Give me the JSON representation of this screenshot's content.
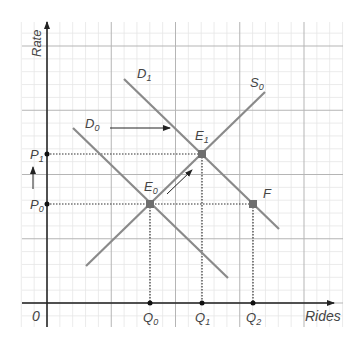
{
  "axes": {
    "x_label": "Rides",
    "y_label": "Rate",
    "origin_label": "0"
  },
  "curves": {
    "D0": {
      "label": "D",
      "sub": "0"
    },
    "D1": {
      "label": "D",
      "sub": "1"
    },
    "S0": {
      "label": "S",
      "sub": "0"
    }
  },
  "points": {
    "E0": {
      "label": "E",
      "sub": "0"
    },
    "E1": {
      "label": "E",
      "sub": "1"
    },
    "F": {
      "label": "F",
      "sub": ""
    }
  },
  "price_ticks": [
    {
      "label": "P",
      "sub": "1"
    },
    {
      "label": "P",
      "sub": "0"
    }
  ],
  "quantity_ticks": [
    {
      "label": "Q",
      "sub": "0"
    },
    {
      "label": "Q",
      "sub": "1"
    },
    {
      "label": "Q",
      "sub": "2"
    }
  ],
  "colors": {
    "curve": "#8a8a8a",
    "axis": "#222222",
    "grid_minor": "#e6e6e6",
    "grid_major": "#b5b5b5",
    "point": "#6e6e6e",
    "dotted": "#333333"
  },
  "chart_data": {
    "type": "line",
    "title": "",
    "xlabel": "Rides",
    "ylabel": "Rate",
    "grid": true,
    "series": [
      {
        "name": "D0",
        "points": [
          [
            0.5,
            3.4
          ],
          [
            3.0,
            0.5
          ]
        ]
      },
      {
        "name": "D1",
        "points": [
          [
            1.2,
            4.4
          ],
          [
            3.7,
            1.4
          ]
        ]
      },
      {
        "name": "S0",
        "points": [
          [
            0.6,
            0.6
          ],
          [
            3.4,
            3.3
          ]
        ]
      }
    ],
    "annotations": [
      {
        "name": "E0",
        "x": "Q0",
        "y": "P0",
        "desc": "initial equilibrium (D0 ∩ S0)"
      },
      {
        "name": "E1",
        "x": "Q1",
        "y": "P1",
        "desc": "new equilibrium (D1 ∩ S0)"
      },
      {
        "name": "F",
        "x": "Q2",
        "y": "P0",
        "desc": "D1 at old price P0"
      },
      {
        "name": "demand-shift-arrow",
        "desc": "D0 → D1 rightward shift"
      },
      {
        "name": "movement-along-supply-arrow",
        "desc": "E0 → E1 along S0"
      },
      {
        "name": "price-rise-arrow",
        "desc": "P0 → P1"
      }
    ],
    "x_ticks": [
      "Q0",
      "Q1",
      "Q2"
    ],
    "y_ticks": [
      "P0",
      "P1"
    ]
  }
}
